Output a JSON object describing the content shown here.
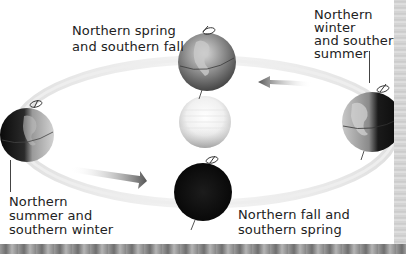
{
  "diagram": {
    "center": {
      "name": "Sun",
      "icon": "sun-icon"
    },
    "orbit_direction": "counterclockwise",
    "positions": [
      {
        "id": "spring",
        "lines": [
          "Northern spring",
          "and southern fall"
        ],
        "globe_shade": "half-lit",
        "location": "top"
      },
      {
        "id": "winter",
        "lines": [
          "Northern",
          "winter",
          "and southern",
          "summer"
        ],
        "globe_shade": "mostly-dark-right",
        "location": "right"
      },
      {
        "id": "summer",
        "lines": [
          "Northern",
          "summer and",
          "southern winter"
        ],
        "globe_shade": "mostly-dark-left",
        "location": "left"
      },
      {
        "id": "fall",
        "lines": [
          "Northern fall and",
          "southern spring"
        ],
        "globe_shade": "dark",
        "location": "bottom"
      }
    ],
    "arrows": [
      {
        "id": "arrow-top",
        "direction": "left"
      },
      {
        "id": "arrow-bottom",
        "direction": "right"
      }
    ],
    "colors": {
      "text": "#222222",
      "orbit": "#cfcfcf",
      "globe_dark": "#111111",
      "globe_light": "#bdbdbd",
      "sun": "#f2f2f2"
    }
  }
}
